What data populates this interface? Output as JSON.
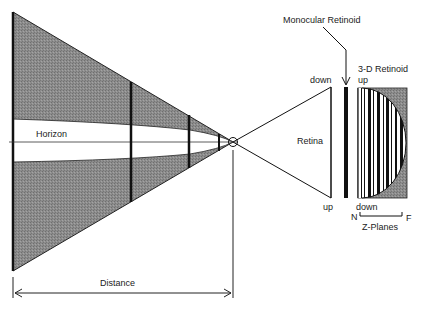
{
  "diagram": {
    "labels": {
      "horizon": "Horizon",
      "distance": "Distance",
      "monocular_retinoid": "Monocular  Retinoid",
      "retinoid_3d": "3-D  Retinoid",
      "retina": "Retina",
      "retina_top": "down",
      "retina_bottom": "up",
      "retinoid_top": "up",
      "retinoid_bottom": "down",
      "z_near": "N",
      "z_far": "F",
      "z_planes": "Z-Planes"
    },
    "colors": {
      "shade": "#8a8a8a",
      "line": "#111111",
      "background": "#ffffff"
    }
  }
}
